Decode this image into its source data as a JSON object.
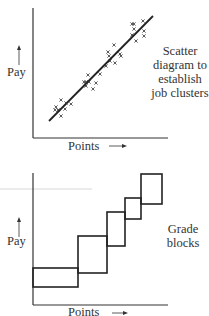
{
  "diagrams": [
    {
      "id": "scatter",
      "y_label": "Pay",
      "x_label": "Points",
      "caption_lines": [
        "Scatter",
        "diagram to",
        "establish",
        "job clusters"
      ]
    },
    {
      "id": "grade-blocks",
      "y_label": "Pay",
      "x_label": "Points",
      "caption_lines": [
        "Grade",
        "blocks"
      ]
    }
  ],
  "chart_data": [
    {
      "type": "scatter",
      "title": "Scatter diagram to establish job clusters",
      "xlabel": "Points",
      "ylabel": "Pay",
      "grid": false,
      "trend_line": {
        "from": [
          49,
          121
        ],
        "to": [
          153,
          16
        ]
      },
      "points_px": [
        [
          56,
          107
        ],
        [
          55,
          110
        ],
        [
          58,
          110
        ],
        [
          61,
          100
        ],
        [
          61,
          116
        ],
        [
          66,
          103
        ],
        [
          65,
          109
        ],
        [
          71,
          104
        ],
        [
          84,
          82
        ],
        [
          86,
          82
        ],
        [
          86,
          86
        ],
        [
          88,
          75
        ],
        [
          89,
          82
        ],
        [
          93,
          89
        ],
        [
          96,
          83
        ],
        [
          100,
          74
        ],
        [
          106,
          66
        ],
        [
          109,
          56
        ],
        [
          108,
          52
        ],
        [
          110,
          61
        ],
        [
          120,
          54
        ],
        [
          114,
          45
        ],
        [
          121,
          56
        ],
        [
          115,
          63
        ],
        [
          132,
          24
        ],
        [
          134,
          29
        ],
        [
          132,
          35
        ],
        [
          134,
          24
        ],
        [
          143,
          21
        ],
        [
          144,
          31
        ],
        [
          144,
          36
        ],
        [
          136,
          41
        ]
      ]
    },
    {
      "type": "diagram",
      "title": "Grade blocks",
      "xlabel": "Points",
      "ylabel": "Pay",
      "blocks_px": [
        {
          "x0": 33,
          "x1": 78,
          "y0": 268,
          "y1": 287
        },
        {
          "x0": 78,
          "x1": 107,
          "y0": 236,
          "y1": 273
        },
        {
          "x0": 107,
          "x1": 125,
          "y0": 212,
          "y1": 246
        },
        {
          "x0": 125,
          "x1": 141,
          "y0": 198,
          "y1": 219
        },
        {
          "x0": 141,
          "x1": 162,
          "y0": 174,
          "y1": 204
        }
      ]
    }
  ]
}
